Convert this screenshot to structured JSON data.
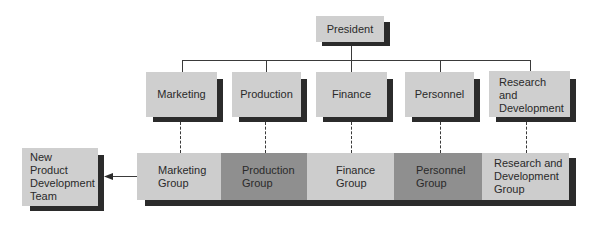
{
  "diagram": {
    "type": "organizational-chart",
    "top": {
      "label": "President"
    },
    "departments": [
      {
        "label": "Marketing"
      },
      {
        "label": "Production"
      },
      {
        "label": "Finance"
      },
      {
        "label": "Personnel"
      },
      {
        "label": "Research and Development",
        "lines": [
          "Research",
          "and",
          "Development"
        ]
      }
    ],
    "groups": [
      {
        "lines": [
          "Marketing",
          "Group"
        ],
        "shade": "light"
      },
      {
        "lines": [
          "Production",
          "Group"
        ],
        "shade": "dark"
      },
      {
        "lines": [
          "Finance",
          "Group"
        ],
        "shade": "light"
      },
      {
        "lines": [
          "Personnel",
          "Group"
        ],
        "shade": "dark"
      },
      {
        "lines": [
          "Research and",
          "Development",
          "Group"
        ],
        "shade": "light"
      }
    ],
    "team": {
      "lines": [
        "New",
        "Product",
        "Development",
        "Team"
      ]
    },
    "colors": {
      "box_light": "#cfcfcf",
      "box_dark": "#8f8f8f",
      "shadow": "#2b2b2b",
      "line": "#3a3a3a"
    }
  }
}
